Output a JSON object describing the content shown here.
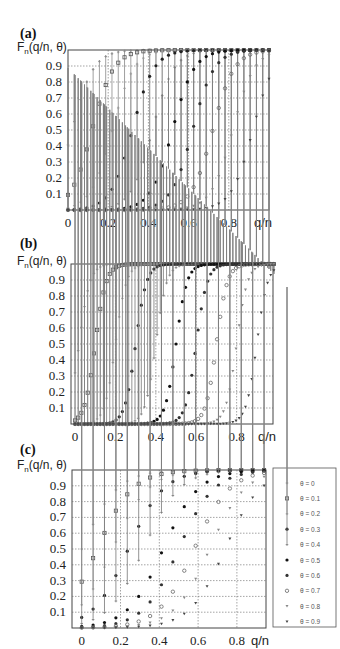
{
  "panels": [
    {
      "label": "(a)",
      "ylabel_main": "F",
      "ylabel_sub": "n",
      "ylabel_rest": "(q/n, θ)",
      "xlabel": "q/n"
    },
    {
      "label": "(b)",
      "ylabel_main": "F",
      "ylabel_sub": "n",
      "ylabel_rest": "(q/n, θ)",
      "xlabel": "q/n"
    },
    {
      "label": "(c)",
      "ylabel_main": "F",
      "ylabel_sub": "n",
      "ylabel_rest": "(q/n, θ)",
      "xlabel": "q/n"
    }
  ],
  "legend": [
    "θ = 0",
    "θ = 0.1",
    "θ = 0.2",
    "θ = 0.3",
    "θ = 0.4",
    "θ = 0.5",
    "θ = 0.6",
    "θ = 0.7",
    "θ = 0.8",
    "θ = 0.9"
  ],
  "chart_data": [
    {
      "type": "scatter",
      "title": "(a)",
      "xlabel": "q/n",
      "ylabel": "F_n(q/n, θ)",
      "xlim": [
        0,
        1
      ],
      "ylim": [
        0,
        1
      ],
      "xticks": [
        "0",
        "0.2",
        "0.4",
        "0.6",
        "0.8"
      ],
      "yticks": [
        "0.1",
        "0.2",
        "0.3",
        "0.4",
        "0.5",
        "0.6",
        "0.7",
        "0.8",
        "0.9"
      ],
      "grid": true,
      "n_points": 32,
      "steepness": 6,
      "series_names": [
        "θ = 0",
        "θ = 0.1",
        "θ = 0.2",
        "θ = 0.3",
        "θ = 0.4",
        "θ = 0.5",
        "θ = 0.6",
        "θ = 0.7",
        "θ = 0.8",
        "θ = 0.9"
      ],
      "midpoints": [
        0.02,
        0.12,
        0.22,
        0.32,
        0.42,
        0.52,
        0.62,
        0.72,
        0.82,
        0.92
      ]
    },
    {
      "type": "scatter",
      "title": "(b)",
      "xlabel": "q/n",
      "ylabel": "F_n(q/n, θ)",
      "xlim": [
        0,
        1
      ],
      "ylim": [
        0,
        1
      ],
      "xticks": [
        "0",
        "0.2",
        "0.4",
        "0.6",
        "0.8"
      ],
      "yticks": [
        "0.1",
        "0.2",
        "0.3",
        "0.4",
        "0.5",
        "0.6",
        "0.7",
        "0.8",
        "0.9"
      ],
      "grid": true,
      "n_points": 64,
      "steepness": 12,
      "series_names": [
        "θ = 0",
        "θ = 0.1",
        "θ = 0.2",
        "θ = 0.3",
        "θ = 0.4",
        "θ = 0.5",
        "θ = 0.6",
        "θ = 0.7",
        "θ = 0.8",
        "θ = 0.9"
      ],
      "midpoints": [
        0.02,
        0.1,
        0.2,
        0.3,
        0.4,
        0.5,
        0.6,
        0.7,
        0.8,
        0.9
      ]
    },
    {
      "type": "scatter",
      "title": "(c)",
      "xlabel": "q/n",
      "ylabel": "F_n(q/n, θ)",
      "xlim": [
        -0.05,
        1.0
      ],
      "ylim": [
        0,
        1
      ],
      "xticks": [
        "0",
        "0.2",
        "0.4",
        "0.6",
        "0.8"
      ],
      "yticks": [
        "0.1",
        "0.2",
        "0.3",
        "0.4",
        "0.5",
        "0.6",
        "0.7",
        "0.8",
        "0.9"
      ],
      "grid": true,
      "n_points": 17,
      "steepness": 3.5,
      "series_names": [
        "θ = 0",
        "θ = 0.1",
        "θ = 0.2",
        "θ = 0.3",
        "θ = 0.4",
        "θ = 0.5",
        "θ = 0.6",
        "θ = 0.7",
        "θ = 0.8",
        "θ = 0.9"
      ],
      "midpoints": [
        0.0,
        0.08,
        0.16,
        0.24,
        0.32,
        0.42,
        0.5,
        0.58,
        0.66,
        0.74
      ],
      "legend_position": "right"
    }
  ]
}
